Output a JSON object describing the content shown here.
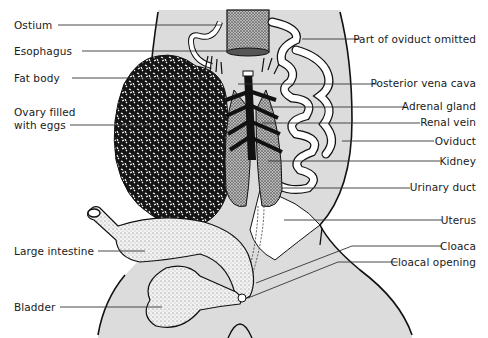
{
  "diagram": {
    "type": "anatomical-illustration",
    "colors": {
      "background": "#ffffff",
      "body_fill": "#dcdcdc",
      "outline": "#111111",
      "leader_line": "#333333",
      "label_text": "#1a1a1a"
    },
    "labels_left": [
      {
        "id": "ostium",
        "text": "Ostium",
        "x": 14,
        "y": 19,
        "line_to": [
          222,
          25
        ]
      },
      {
        "id": "esophagus",
        "text": "Esophagus",
        "x": 14,
        "y": 45,
        "line_to": [
          228,
          51
        ]
      },
      {
        "id": "fat-body",
        "text": "Fat body",
        "x": 14,
        "y": 72,
        "line_to": [
          205,
          78
        ]
      },
      {
        "id": "ovary",
        "text": "Ovary filled\nwith eggs",
        "line1": "Ovary filled",
        "line2": "with eggs",
        "x": 14,
        "y": 106,
        "line_to": [
          152,
          125
        ]
      },
      {
        "id": "large-intestine",
        "text": "Large intestine",
        "x": 14,
        "y": 245,
        "line_to": [
          145,
          251
        ]
      },
      {
        "id": "bladder",
        "text": "Bladder",
        "x": 14,
        "y": 302,
        "line_to": [
          162,
          307
        ]
      }
    ],
    "labels_right": [
      {
        "id": "part-of-oviduct-omitted",
        "text": "Part of oviduct omitted",
        "x": 476,
        "y": 33,
        "line_from": [
          302,
          39
        ]
      },
      {
        "id": "posterior-vena-cava",
        "text": "Posterior vena cava",
        "x": 476,
        "y": 77,
        "line_from": [
          238,
          84
        ]
      },
      {
        "id": "adrenal-gland",
        "text": "Adrenal gland",
        "x": 476,
        "y": 100,
        "line_from": [
          270,
          107
        ]
      },
      {
        "id": "renal-vein",
        "text": "Renal vein",
        "x": 476,
        "y": 116,
        "line_from": [
          262,
          123
        ]
      },
      {
        "id": "oviduct",
        "text": "Oviduct",
        "x": 476,
        "y": 134,
        "line_from": [
          342,
          141
        ]
      },
      {
        "id": "kidney",
        "text": "Kidney",
        "x": 476,
        "y": 154,
        "line_from": [
          268,
          161
        ]
      },
      {
        "id": "urinary-duct",
        "text": "Urinary duct",
        "x": 476,
        "y": 181,
        "line_from": [
          282,
          188
        ]
      },
      {
        "id": "uterus",
        "text": "Uterus",
        "x": 476,
        "y": 213,
        "line_from": [
          284,
          220
        ]
      },
      {
        "id": "cloaca",
        "text": "Cloaca",
        "x": 476,
        "y": 240,
        "line_from": [
          256,
          283
        ]
      },
      {
        "id": "cloacal-opening",
        "text": "Cloacal opening",
        "x": 476,
        "y": 256,
        "line_from": [
          248,
          298
        ]
      }
    ]
  }
}
